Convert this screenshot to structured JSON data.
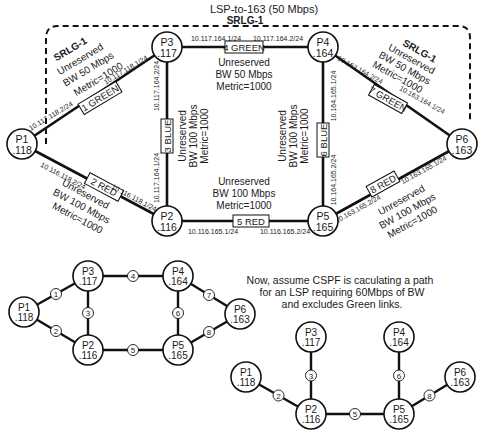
{
  "lsp_label": "LSP-to-163 (50 Mbps)",
  "srlg_label": "SRLG-1",
  "note": [
    "Now, assume CSPF is caculating a path",
    "for an LSP requiring 60Mbps of BW",
    "and excludes Green links."
  ],
  "colors": {
    "line": "#111111",
    "node_fill": "#ffffff",
    "text": "#1a1a1a",
    "background": "#ffffff"
  },
  "top_diagram": {
    "nodes": [
      {
        "id": "P1",
        "name": "P1",
        "addr": ".118",
        "x": 22,
        "y": 144
      },
      {
        "id": "P2",
        "name": "P2",
        "addr": ".116",
        "x": 167,
        "y": 221
      },
      {
        "id": "P3",
        "name": "P3",
        "addr": ".117",
        "x": 167,
        "y": 47
      },
      {
        "id": "P4",
        "name": "P4",
        "addr": ".164",
        "x": 323,
        "y": 47
      },
      {
        "id": "P5",
        "name": "P5",
        "addr": ".165",
        "x": 323,
        "y": 221
      },
      {
        "id": "P6",
        "name": "P6",
        "addr": ".163",
        "x": 462,
        "y": 144
      }
    ],
    "links": [
      {
        "id": 1,
        "from": "P1",
        "to": "P3",
        "label": "1 GREEN",
        "srlg": "SRLG-1",
        "bw": "Unreserved",
        "bw2": "BW 50 Mbps",
        "metric": "Metric=1000",
        "ip_a": "10.117.118.2/24",
        "ip_b": "10.117.118.1/24"
      },
      {
        "id": 2,
        "from": "P1",
        "to": "P2",
        "label": "2 RED",
        "bw": "Unreserved",
        "bw2": "BW 100 Mbps",
        "metric": "Metric=1000",
        "ip_a": "10.116.118.2/24",
        "ip_b": "10.116.118.1/24"
      },
      {
        "id": 3,
        "from": "P3",
        "to": "P2",
        "label": "3 BLUE",
        "bw": "Unreserved",
        "bw2": "BW 100 Mbps",
        "metric": "Metric=1000",
        "ip_a": "10.117.164.2/24",
        "ip_b": "10.117.164.1/24"
      },
      {
        "id": 4,
        "from": "P3",
        "to": "P4",
        "label": "4 GREEN",
        "srlg": "SRLG-1",
        "bw": "Unreserved",
        "bw2": "BW 50 Mbps",
        "metric": "Metric=1000",
        "ip_a": "10.117.164.1/24",
        "ip_b": "10.117.164.2/24"
      },
      {
        "id": 5,
        "from": "P2",
        "to": "P5",
        "label": "5 RED",
        "bw": "Unreserved",
        "bw2": "BW 100 Mbps",
        "metric": "Metric=1000",
        "ip_a": "10.116.165.1/24",
        "ip_b": "10.116.165.2/24"
      },
      {
        "id": 6,
        "from": "P4",
        "to": "P5",
        "label": "6 BLUE",
        "bw": "Unreserved",
        "bw2": "BW 100 Mbps",
        "metric": "Metric=1000",
        "ip_a": "10.164.165.1/24",
        "ip_b": "10.164.165.2/24"
      },
      {
        "id": 7,
        "from": "P4",
        "to": "P6",
        "label": "7 GREEN",
        "srlg": "SRLG-1",
        "bw": "Unreserved",
        "bw2": "BW 50 Mbps",
        "metric": "Metric=1000",
        "ip_a": "10.163.164.2/24",
        "ip_b": "10.163.164.1/24"
      },
      {
        "id": 8,
        "from": "P5",
        "to": "P6",
        "label": "8 RED",
        "bw": "Unreserved",
        "bw2": "BW 100 Mbps",
        "metric": "Metric=1000",
        "ip_a": "10.163.165.2/24",
        "ip_b": "10.163.165.1/24"
      }
    ]
  },
  "bottom_left_diagram": {
    "nodes": [
      {
        "name": "P1",
        "addr": ".118",
        "x": 24,
        "y": 312
      },
      {
        "name": "P3",
        "addr": ".117",
        "x": 88,
        "y": 276
      },
      {
        "name": "P2",
        "addr": ".116",
        "x": 88,
        "y": 350
      },
      {
        "name": "P4",
        "addr": ".164",
        "x": 178,
        "y": 276
      },
      {
        "name": "P5",
        "addr": ".165",
        "x": 178,
        "y": 350
      },
      {
        "name": "P6",
        "addr": ".163",
        "x": 240,
        "y": 314
      }
    ],
    "links": [
      {
        "n": "1",
        "a": 0,
        "b": 1
      },
      {
        "n": "2",
        "a": 0,
        "b": 2
      },
      {
        "n": "3",
        "a": 1,
        "b": 2
      },
      {
        "n": "4",
        "a": 1,
        "b": 3
      },
      {
        "n": "5",
        "a": 2,
        "b": 4
      },
      {
        "n": "6",
        "a": 3,
        "b": 4
      },
      {
        "n": "7",
        "a": 3,
        "b": 5
      },
      {
        "n": "8",
        "a": 4,
        "b": 5
      }
    ]
  },
  "bottom_right_diagram": {
    "nodes": [
      {
        "name": "P1",
        "addr": ".118",
        "x": 246,
        "y": 377
      },
      {
        "name": "P3",
        "addr": ".117",
        "x": 311,
        "y": 337
      },
      {
        "name": "P2",
        "addr": ".116",
        "x": 311,
        "y": 414
      },
      {
        "name": "P4",
        "addr": ".164",
        "x": 399,
        "y": 337
      },
      {
        "name": "P5",
        "addr": ".165",
        "x": 399,
        "y": 414
      },
      {
        "name": "P6",
        "addr": ".163",
        "x": 460,
        "y": 377
      }
    ],
    "links": [
      {
        "n": "2",
        "a": 0,
        "b": 2
      },
      {
        "n": "3",
        "a": 1,
        "b": 2
      },
      {
        "n": "5",
        "a": 2,
        "b": 4
      },
      {
        "n": "6",
        "a": 3,
        "b": 4
      },
      {
        "n": "8",
        "a": 4,
        "b": 5
      }
    ]
  }
}
